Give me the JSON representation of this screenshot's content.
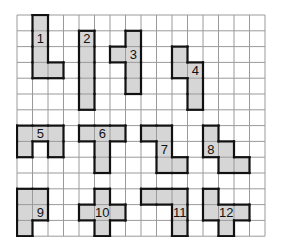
{
  "grid": {
    "cols": 16,
    "rows": 14,
    "cell_w": 15.5,
    "cell_h": 15.8,
    "line_color": "#9a9a9a",
    "fill_color": "#d6d6d6",
    "outline_color": "#111111"
  },
  "pieces": [
    {
      "label": "1",
      "cells": [
        [
          1,
          0
        ],
        [
          1,
          1
        ],
        [
          1,
          2
        ],
        [
          1,
          3
        ],
        [
          2,
          3
        ]
      ],
      "label_cell": [
        1,
        1
      ]
    },
    {
      "label": "2",
      "cells": [
        [
          4,
          1
        ],
        [
          4,
          2
        ],
        [
          4,
          3
        ],
        [
          4,
          4
        ],
        [
          4,
          5
        ]
      ],
      "label_cell": [
        4,
        1
      ]
    },
    {
      "label": "3",
      "cells": [
        [
          7,
          1
        ],
        [
          6,
          2
        ],
        [
          7,
          2
        ],
        [
          7,
          3
        ],
        [
          7,
          4
        ]
      ],
      "label_cell": [
        7,
        2
      ]
    },
    {
      "label": "4",
      "cells": [
        [
          10,
          2
        ],
        [
          10,
          3
        ],
        [
          11,
          3
        ],
        [
          11,
          4
        ],
        [
          11,
          5
        ]
      ],
      "label_cell": [
        11,
        3
      ]
    },
    {
      "label": "5",
      "cells": [
        [
          0,
          7
        ],
        [
          1,
          7
        ],
        [
          2,
          7
        ],
        [
          0,
          8
        ],
        [
          2,
          8
        ]
      ],
      "label_cell": [
        1,
        7
      ]
    },
    {
      "label": "6",
      "cells": [
        [
          4,
          7
        ],
        [
          5,
          7
        ],
        [
          6,
          7
        ],
        [
          5,
          8
        ],
        [
          5,
          9
        ]
      ],
      "label_cell": [
        5,
        7
      ]
    },
    {
      "label": "7",
      "cells": [
        [
          8,
          7
        ],
        [
          9,
          7
        ],
        [
          9,
          8
        ],
        [
          9,
          9
        ],
        [
          10,
          9
        ]
      ],
      "label_cell": [
        9,
        8
      ]
    },
    {
      "label": "8",
      "cells": [
        [
          12,
          7
        ],
        [
          12,
          8
        ],
        [
          13,
          8
        ],
        [
          13,
          9
        ],
        [
          14,
          9
        ]
      ],
      "label_cell": [
        12,
        8
      ]
    },
    {
      "label": "9",
      "cells": [
        [
          0,
          11
        ],
        [
          1,
          11
        ],
        [
          0,
          12
        ],
        [
          1,
          12
        ],
        [
          0,
          13
        ]
      ],
      "label_cell": [
        1,
        12
      ]
    },
    {
      "label": "10",
      "cells": [
        [
          5,
          11
        ],
        [
          4,
          12
        ],
        [
          5,
          12
        ],
        [
          6,
          12
        ],
        [
          5,
          13
        ]
      ],
      "label_cell": [
        5,
        12
      ]
    },
    {
      "label": "11",
      "cells": [
        [
          8,
          11
        ],
        [
          9,
          11
        ],
        [
          10,
          11
        ],
        [
          10,
          12
        ],
        [
          10,
          13
        ]
      ],
      "label_cell": [
        10,
        12
      ]
    },
    {
      "label": "12",
      "cells": [
        [
          12,
          11
        ],
        [
          12,
          12
        ],
        [
          13,
          12
        ],
        [
          14,
          12
        ],
        [
          13,
          13
        ]
      ],
      "label_cell": [
        13,
        12
      ]
    }
  ]
}
